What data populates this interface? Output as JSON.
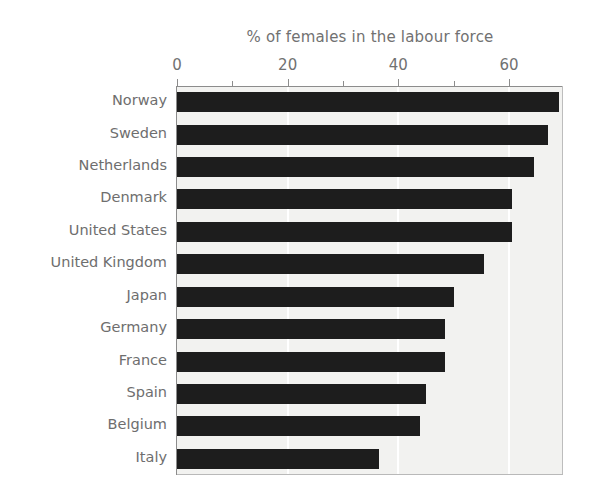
{
  "chart_data": {
    "type": "bar",
    "orientation": "horizontal",
    "title": "% of females in the labour force",
    "xlabel": "",
    "ylabel": "",
    "xlim": [
      0,
      69.7
    ],
    "xticks": [
      0,
      20,
      40,
      60
    ],
    "xtick_labels": [
      "0",
      "20",
      "40",
      "60"
    ],
    "minor_xticks": [
      10,
      30,
      50
    ],
    "grid": "vertical white gridlines at major ticks",
    "legend": "none",
    "bar_color": "#1d1d1d",
    "plot_background": "#f2f2f0",
    "categories": [
      "Norway",
      "Sweden",
      "Netherlands",
      "Denmark",
      "United States",
      "United Kingdom",
      "Japan",
      "Germany",
      "France",
      "Spain",
      "Belgium",
      "Italy"
    ],
    "values": [
      69,
      67,
      64.5,
      60.5,
      60.5,
      55.5,
      50,
      48.5,
      48.5,
      45,
      44,
      36.5
    ]
  },
  "axis": {
    "tick_labels": [
      "0",
      "20",
      "40",
      "60"
    ]
  },
  "title": {
    "text": "% of females in the labour force"
  }
}
